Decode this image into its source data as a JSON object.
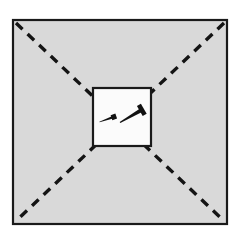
{
  "figure": {
    "canvas": {
      "width": 237,
      "height": 233,
      "background_color": "#ffffff"
    },
    "outer_square": {
      "name": "panel",
      "x": 13,
      "y": 20,
      "width": 214,
      "height": 204,
      "fill_color": "#d9d9d9",
      "stroke_color": "#1a1a1a",
      "stroke_width": 2.2
    },
    "diagonals": {
      "name": "fold-lines",
      "style": "dashed",
      "stroke_color": "#141414",
      "stroke_width": 3.4,
      "dash_length": 9,
      "gap_length": 7,
      "lines": [
        {
          "name": "diagonal-top-left-to-bottom-right",
          "x1": 16,
          "y1": 23,
          "x2": 224,
          "y2": 221
        },
        {
          "name": "diagonal-top-right-to-bottom-left",
          "x1": 224,
          "y1": 23,
          "x2": 16,
          "y2": 221
        }
      ]
    },
    "inner_square": {
      "name": "detail-inset",
      "x": 93,
      "y": 88,
      "width": 58,
      "height": 58,
      "fill_color": "#fbfbfb",
      "stroke_color": "#1a1a1a",
      "stroke_width": 2.2
    },
    "fasteners": [
      {
        "name": "small-nail",
        "label": "small nail",
        "head_x": 113.5,
        "head_y": 117.0,
        "tip_x": 99.5,
        "tip_y": 122.0,
        "shaft_thickness": 2.6,
        "head_width": 5.0,
        "head_height": 5.2,
        "color": "#111111"
      },
      {
        "name": "large-nail",
        "label": "large nail",
        "head_x": 141.5,
        "head_y": 110.0,
        "tip_x": 120.0,
        "tip_y": 122.5,
        "shaft_thickness": 4.2,
        "head_width": 4.6,
        "head_height": 11.5,
        "color": "#111111"
      }
    ]
  }
}
